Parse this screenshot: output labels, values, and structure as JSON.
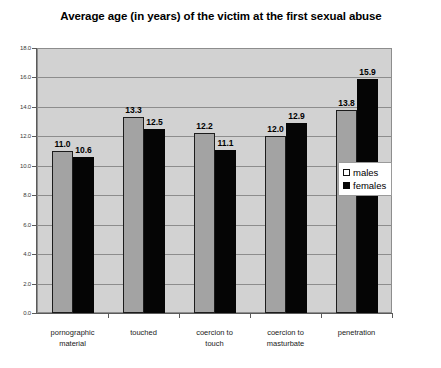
{
  "chart_data": {
    "type": "bar",
    "title": "Average age (in years) of the victim at the first sexual abuse",
    "title_line1": "Average age (in years) of the victim at the first sexual",
    "title_line2": "abuse",
    "xlabel": "",
    "ylabel": "",
    "ylim": [
      0,
      18
    ],
    "ytick_step": 2,
    "grid": true,
    "legend_position": "center-right-inside",
    "categories": [
      "pornographic material",
      "touched",
      "coercion to touch",
      "coercion to masturbate",
      "penetration"
    ],
    "category_lines": [
      [
        "pornographic",
        "material"
      ],
      [
        "touched"
      ],
      [
        "coercion to",
        "touch"
      ],
      [
        "coercion to",
        "masturbate"
      ],
      [
        "penetration"
      ]
    ],
    "ytick_labels": [
      "0.0",
      "2.0",
      "4.0",
      "6.0",
      "8.0",
      "10.0",
      "12.0",
      "14.0",
      "16.0",
      "18.0"
    ],
    "ytick_values": [
      0,
      2,
      4,
      6,
      8,
      10,
      12,
      14,
      16,
      18
    ],
    "series": [
      {
        "name": "males",
        "color": "#a3a3a3",
        "values": [
          11.0,
          13.3,
          12.2,
          12.0,
          13.8
        ],
        "labels": [
          "11.0",
          "13.3",
          "12.2",
          "12.0",
          "13.8"
        ]
      },
      {
        "name": "females",
        "color": "#050505",
        "values": [
          10.6,
          12.5,
          11.1,
          12.9,
          15.9
        ],
        "labels": [
          "10.6",
          "12.5",
          "11.1",
          "12.9",
          "15.9"
        ]
      }
    ]
  },
  "legend": {
    "items": [
      {
        "label": "males",
        "swatch": "males"
      },
      {
        "label": "females",
        "swatch": "females"
      }
    ]
  },
  "colors": {
    "plot_background": "#d2d2d2",
    "gridline": "#8d8d8d",
    "males_bar": "#a3a3a3",
    "females_bar": "#050505",
    "page_background": "#ffffff"
  }
}
